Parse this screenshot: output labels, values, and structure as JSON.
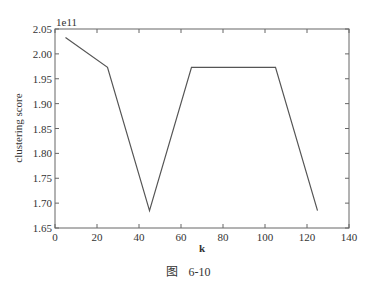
{
  "chart_data": {
    "type": "line",
    "title": "",
    "xlabel": "k",
    "ylabel": "clustering score",
    "y_offset_label": "1e11",
    "x": [
      5,
      25,
      45,
      65,
      85,
      105,
      125
    ],
    "series": [
      {
        "name": "clustering score",
        "values": [
          2.033,
          1.973,
          1.685,
          1.973,
          1.973,
          1.973,
          1.685
        ]
      }
    ],
    "xlim": [
      0,
      140
    ],
    "ylim": [
      1.65,
      2.05
    ],
    "x_ticks": [
      0,
      20,
      40,
      60,
      80,
      100,
      120,
      140
    ],
    "y_ticks": [
      "1.65",
      "1.70",
      "1.75",
      "1.80",
      "1.85",
      "1.90",
      "1.95",
      "2.00",
      "2.05"
    ],
    "grid": false,
    "legend": null,
    "line_color": "#555555"
  },
  "caption": {
    "prefix": "图",
    "number": "6-10"
  }
}
